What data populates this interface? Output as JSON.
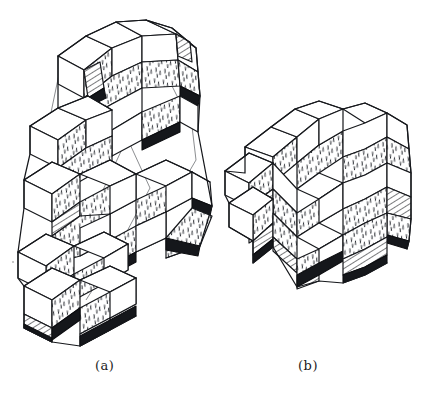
{
  "figure": {
    "kind": "line-drawing",
    "medium": "scanned ink illustration",
    "background_color": "#ffffff",
    "ink_color": "#16181c",
    "panels": [
      {
        "id": "a",
        "caption": "(a)",
        "description": "Elongated chain-like aggregate of rhombic cells running from upper right to lower left",
        "shape": "elongated helical cluster",
        "orientation": "diagonal, upper-right to lower-left",
        "cell_count_visible": 22,
        "has_thin_construction_lines": true,
        "bounds": {
          "x": 20,
          "y": 18,
          "width": 215,
          "height": 322
        }
      },
      {
        "id": "b",
        "caption": "(b)",
        "description": "Compact rounded aggregate of rhombic cells forming a near-spherical cluster",
        "shape": "compact spheroidal cluster",
        "orientation": "upright",
        "cell_count_visible": 20,
        "has_thin_construction_lines": false,
        "bounds": {
          "x": 232,
          "y": 105,
          "width": 178,
          "height": 172
        }
      }
    ],
    "face_styles": [
      {
        "name": "white-face",
        "label": "unshaded face",
        "fill": "#ffffff"
      },
      {
        "name": "stipple-face",
        "label": "short-dash stippled",
        "fill": "#ffffff",
        "marks": "#2a2d33"
      },
      {
        "name": "hatch-face",
        "label": "diagonal line hatched",
        "fill": "#ffffff",
        "marks": "#16181c"
      },
      {
        "name": "dark-face",
        "label": "solid shadow face",
        "fill": "#15171b"
      }
    ]
  },
  "captions": {
    "a": "(a)",
    "b": "(b)"
  }
}
